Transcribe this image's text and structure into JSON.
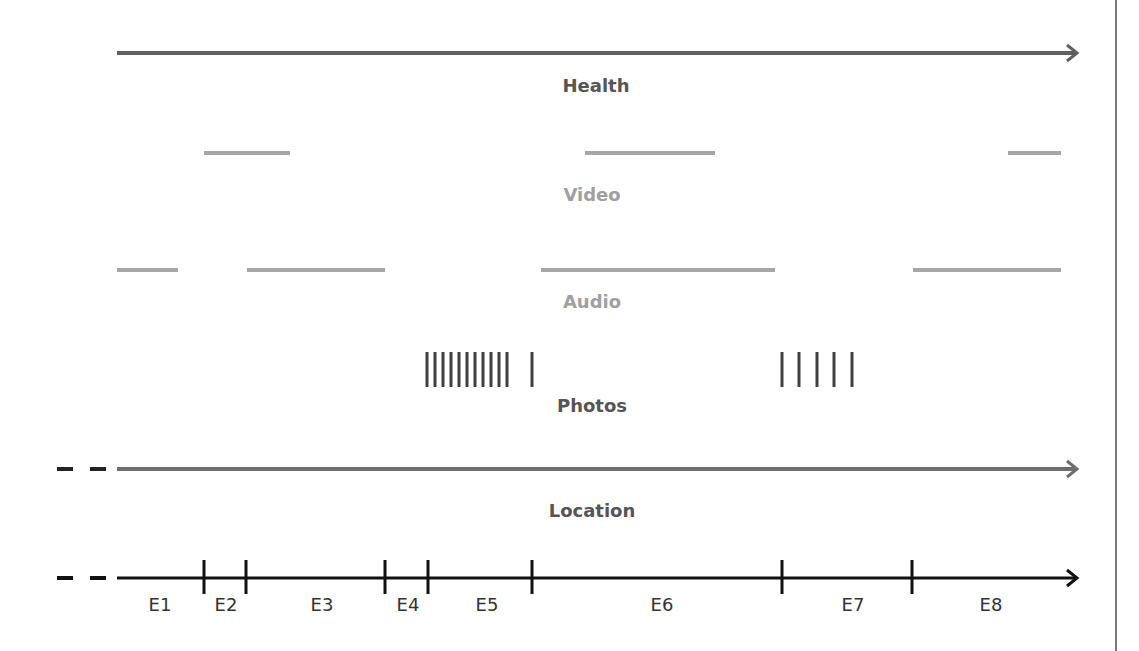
{
  "diagram": {
    "colors": {
      "health": "#606060",
      "video": "#a6a6a6",
      "audio": "#a6a6a6",
      "photos": "#404040",
      "location": "#6e6e6e",
      "events": "#111111",
      "label_dark": "#555555",
      "label_light": "#a0a0a0",
      "border": "#7a7a7a"
    },
    "streams": [
      {
        "name": "Health",
        "label_x": 596,
        "label_y": 92,
        "type": "continuous",
        "y": 53,
        "x_start": 117,
        "x_end": 1077,
        "arrow": true
      },
      {
        "name": "Video",
        "label_x": 592,
        "label_y": 201,
        "type": "segments",
        "y": 153,
        "segments": [
          [
            204,
            290
          ],
          [
            585,
            715
          ],
          [
            1008,
            1061
          ]
        ]
      },
      {
        "name": "Audio",
        "label_x": 592,
        "label_y": 308,
        "type": "segments",
        "y": 270,
        "segments": [
          [
            117,
            178
          ],
          [
            247,
            385
          ],
          [
            541,
            775
          ],
          [
            913,
            1061
          ]
        ]
      },
      {
        "name": "Photos",
        "label_x": 592,
        "label_y": 412,
        "type": "instants",
        "y1": 352,
        "y2": 387,
        "marks": [
          427,
          435,
          443,
          451,
          459,
          467,
          475,
          483,
          491,
          499,
          507,
          532,
          782,
          799,
          817,
          834,
          852
        ]
      },
      {
        "name": "Location",
        "label_x": 592,
        "label_y": 517,
        "type": "continuous",
        "y": 469,
        "x_start": 117,
        "x_end": 1077,
        "arrow": true,
        "leading_dashes": [
          [
            57,
            73
          ],
          [
            90,
            106
          ]
        ]
      }
    ],
    "events_axis": {
      "y": 578,
      "x_start": 117,
      "x_end": 1077,
      "leading_dashes": [
        [
          57,
          73
        ],
        [
          90,
          106
        ]
      ],
      "boundaries": [
        204,
        246,
        385,
        428,
        532,
        782,
        912
      ],
      "labels": [
        {
          "text": "E1",
          "x": 160
        },
        {
          "text": "E2",
          "x": 226
        },
        {
          "text": "E3",
          "x": 322
        },
        {
          "text": "E4",
          "x": 408
        },
        {
          "text": "E5",
          "x": 487
        },
        {
          "text": "E6",
          "x": 662
        },
        {
          "text": "E7",
          "x": 853
        },
        {
          "text": "E8",
          "x": 991
        }
      ],
      "label_y": 611
    }
  }
}
